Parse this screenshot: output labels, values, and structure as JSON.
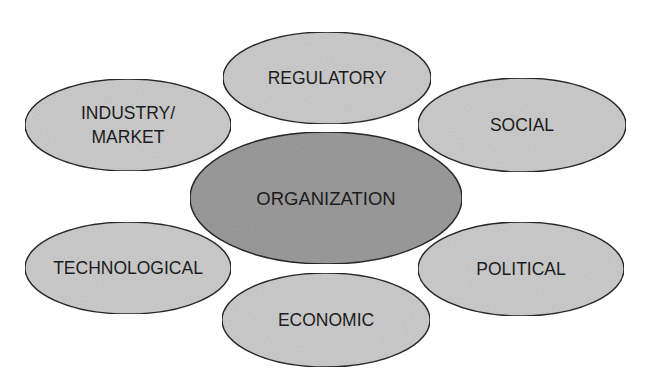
{
  "diagram": {
    "type": "hub-and-spoke ellipse diagram",
    "colors": {
      "background": "#ffffff",
      "center_fill": "#9e9e9e",
      "outer_fill": "#cfcfcf",
      "stroke": "#2a2a2a",
      "text": "#1c1c1c"
    },
    "center": {
      "id": "organization",
      "lines": [
        "ORGANIZATION"
      ],
      "cx": 326,
      "cy": 198,
      "rx": 136,
      "ry": 66
    },
    "nodes": [
      {
        "id": "regulatory",
        "lines": [
          "REGULATORY"
        ],
        "cx": 327,
        "cy": 78,
        "rx": 104,
        "ry": 46
      },
      {
        "id": "industry-market",
        "lines": [
          "INDUSTRY/",
          "MARKET"
        ],
        "cx": 128,
        "cy": 125,
        "rx": 103,
        "ry": 46
      },
      {
        "id": "social",
        "lines": [
          "SOCIAL"
        ],
        "cx": 522,
        "cy": 125,
        "rx": 104,
        "ry": 47
      },
      {
        "id": "technological",
        "lines": [
          "TECHNOLOGICAL"
        ],
        "cx": 128,
        "cy": 268,
        "rx": 103,
        "ry": 46
      },
      {
        "id": "political",
        "lines": [
          "POLITICAL"
        ],
        "cx": 521,
        "cy": 269,
        "rx": 103,
        "ry": 47
      },
      {
        "id": "economic",
        "lines": [
          "ECONOMIC"
        ],
        "cx": 326,
        "cy": 320,
        "rx": 104,
        "ry": 47
      }
    ]
  }
}
